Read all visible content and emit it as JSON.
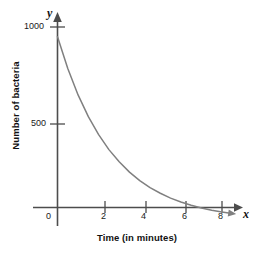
{
  "chart_data": {
    "type": "line",
    "title": "",
    "subtitle": "",
    "xlabel": "Time (in minutes)",
    "ylabel": "Number of bacteria",
    "x_axis_variable": "x",
    "y_axis_variable": "y",
    "xlim": [
      0,
      8.6
    ],
    "ylim": [
      0,
      1080
    ],
    "xticks": [
      0,
      2,
      4,
      6,
      8
    ],
    "xtick_labels": [
      "0",
      "2",
      "4",
      "6",
      "8"
    ],
    "yticks": [
      500,
      1000
    ],
    "ytick_labels": [
      "500",
      "1000"
    ],
    "grid": false,
    "legend": null,
    "annotations": [],
    "series": [
      {
        "name": "Bacteria population decay",
        "color": "#808080",
        "arrow_end": true,
        "x": [
          0,
          0.5,
          1,
          1.5,
          2,
          2.5,
          3,
          3.5,
          4,
          4.5,
          5,
          5.5,
          6,
          6.5,
          7,
          7.5,
          8,
          8.4
        ],
        "values": [
          950,
          786,
          650,
          538,
          445,
          368,
          305,
          252,
          208,
          172,
          143,
          118,
          98,
          81,
          67,
          55,
          46,
          40
        ]
      }
    ]
  },
  "axis": {
    "x_variable_label": "x",
    "y_variable_label": "y",
    "x_title": "Time (in minutes)",
    "y_title": "Number of bacteria",
    "ytick_1000": "1000",
    "ytick_500": "500",
    "xtick_0": "0",
    "xtick_2": "2",
    "xtick_4": "4",
    "xtick_6": "6",
    "xtick_8": "8"
  },
  "colors": {
    "curve": "#808080",
    "axis": "#4d4d4d",
    "text": "#111111",
    "background": "#ffffff"
  }
}
